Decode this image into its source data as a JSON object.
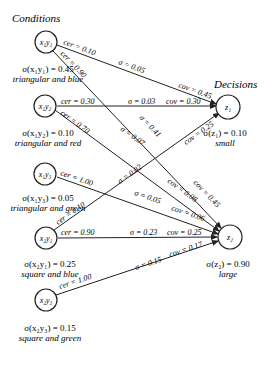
{
  "titles": {
    "conditions": "Conditions",
    "decisions": "Decisions"
  },
  "conditions": [
    {
      "id": "x1y1",
      "label": "x₁y₁",
      "sigma": "σ(x₁y₁) = 0.45",
      "desc": "triangular and blue"
    },
    {
      "id": "x1y2",
      "label": "x₁y₂",
      "sigma": "σ(x₁y₂) = 0.10",
      "desc": "triangular and red"
    },
    {
      "id": "x1y3",
      "label": "x₁y₃",
      "sigma": "σ(x₁y₃) = 0.05",
      "desc": "triangular and green"
    },
    {
      "id": "x2y1",
      "label": "x₂y₁",
      "sigma": "σ(x₂y₁) = 0.25",
      "desc": "square and blue"
    },
    {
      "id": "x2y3",
      "label": "x₂y₃",
      "sigma": "σ(x₂y₃) = 0.15",
      "desc": "square and green"
    }
  ],
  "decisions": [
    {
      "id": "z1",
      "label": "z₁",
      "sigma": "σ(z₁) = 0.10",
      "desc": "small"
    },
    {
      "id": "z2",
      "label": "z₂",
      "sigma": "σ(z₂) = 0.90",
      "desc": "large"
    }
  ],
  "edges": [
    {
      "from": "x1y1",
      "to": "z1",
      "cer": "cer = 0.10",
      "sigma": "σ = 0.05",
      "cov": "cov = 0.45"
    },
    {
      "from": "x1y1",
      "to": "z2",
      "cer": "cer = 0.90",
      "sigma": "σ = 0.41",
      "cov": "cov = 0.45"
    },
    {
      "from": "x1y2",
      "to": "z1",
      "cer": "cer = 0.30",
      "sigma": "σ = 0.03",
      "cov": "cov = 0.30"
    },
    {
      "from": "x1y2",
      "to": "z2",
      "cer": "cer = 0.70",
      "sigma": "σ = 0.07",
      "cov": "cov = 0.08"
    },
    {
      "from": "x1y3",
      "to": "z2",
      "cer": "cer = 1.00",
      "sigma": "σ = 0.05",
      "cov": "cov = 0.06"
    },
    {
      "from": "x2y1",
      "to": "z1",
      "cer": "cer = 0.10",
      "sigma": "σ = 0.02",
      "cov": "cov = 0.25"
    },
    {
      "from": "x2y1",
      "to": "z2",
      "cer": "cer = 0.90",
      "sigma": "σ = 0.23",
      "cov": "cov = 0.25"
    },
    {
      "from": "x2y3",
      "to": "z2",
      "cer": "cer = 1.00",
      "sigma": "σ = 0.15",
      "cov": "cov = 0.17"
    }
  ]
}
